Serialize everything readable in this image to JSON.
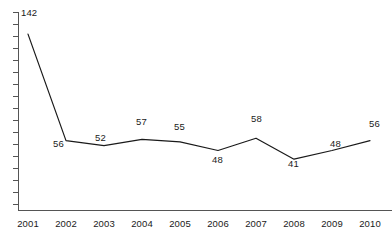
{
  "chart_data": {
    "type": "line",
    "title": "",
    "subtitle": "",
    "xlabel": "",
    "ylabel": "",
    "grid": false,
    "legend": false,
    "categories": [
      "2001",
      "2002",
      "2003",
      "2004",
      "2005",
      "2006",
      "2007",
      "2008",
      "2009",
      "2010"
    ],
    "values": [
      142,
      56,
      52,
      57,
      55,
      48,
      58,
      41,
      48,
      56
    ],
    "ylim": [
      0,
      155
    ],
    "xlim": [
      "2001",
      "2010"
    ],
    "series": [
      {
        "name": "",
        "values": [
          142,
          56,
          52,
          57,
          55,
          48,
          58,
          41,
          48,
          56
        ]
      }
    ],
    "point_labels": [
      {
        "text": "142",
        "value": 142,
        "category": "2001",
        "x": 21,
        "y": 8,
        "position": "right"
      },
      {
        "text": "56",
        "value": 56,
        "category": "2002",
        "x": 53,
        "y": 139,
        "position": "below-left"
      },
      {
        "text": "52",
        "value": 52,
        "category": "2003",
        "x": 95,
        "y": 133,
        "position": "above-left"
      },
      {
        "text": "57",
        "value": 57,
        "category": "2004",
        "x": 136,
        "y": 117,
        "position": "above"
      },
      {
        "text": "55",
        "value": 55,
        "category": "2005",
        "x": 174,
        "y": 122,
        "position": "above"
      },
      {
        "text": "48",
        "value": 48,
        "category": "2006",
        "x": 212,
        "y": 155,
        "position": "below"
      },
      {
        "text": "58",
        "value": 58,
        "category": "2007",
        "x": 251,
        "y": 114,
        "position": "above"
      },
      {
        "text": "41",
        "value": 41,
        "category": "2008",
        "x": 288,
        "y": 159,
        "position": "below"
      },
      {
        "text": "48",
        "value": 48,
        "category": "2009",
        "x": 330,
        "y": 139,
        "position": "above-left"
      },
      {
        "text": "56",
        "value": 56,
        "category": "2010",
        "x": 369,
        "y": 119,
        "position": "above"
      }
    ],
    "axis": {
      "y_tick_count": 17,
      "y_tick_labels": [],
      "x_tick_labels": [
        "2001",
        "2002",
        "2003",
        "2004",
        "2005",
        "2006",
        "2007",
        "2008",
        "2009",
        "2010"
      ],
      "x_label_positions": [
        28,
        66,
        104,
        142,
        180,
        218,
        256,
        294,
        332,
        370
      ],
      "x_label_y": 218
    },
    "colors": {
      "line": "#1a1a1a",
      "axis": "#555555",
      "background": "#ffffff",
      "text": "#1a1a1a"
    }
  }
}
